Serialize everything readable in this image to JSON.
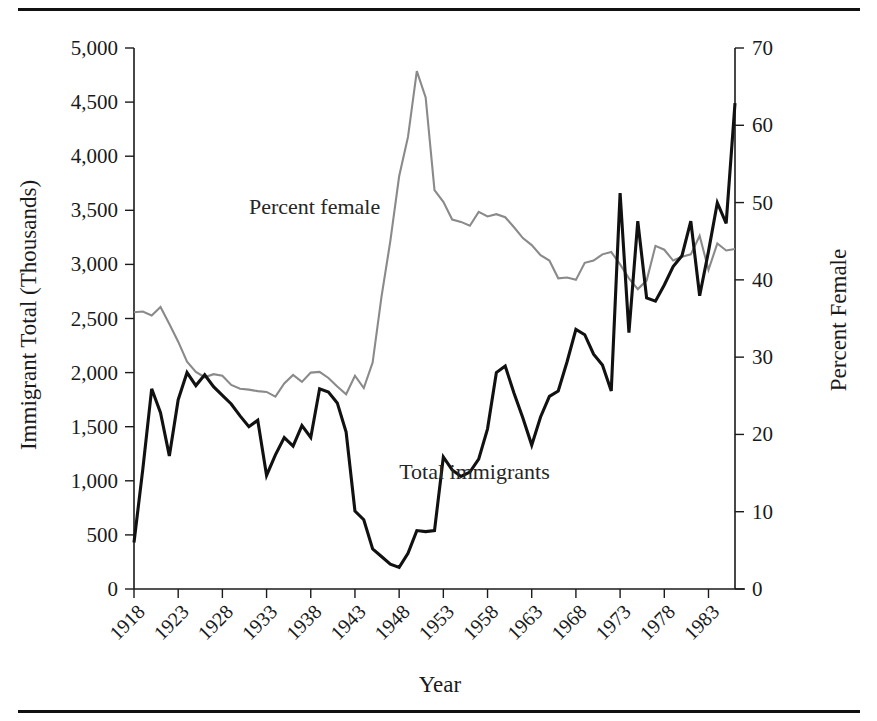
{
  "figure": {
    "top_rule": "horizontal-rule",
    "bottom_rule": "horizontal-rule"
  },
  "chart_data": {
    "type": "line",
    "title": "",
    "xlabel": "Year",
    "ylabel": "Immigrant Total (Thousands)",
    "y2label": "Percent Female",
    "grid": false,
    "legend": "inline-annotations",
    "xlim": [
      1918,
      1986
    ],
    "ylim": [
      0,
      5000
    ],
    "y2lim": [
      0,
      70
    ],
    "yticks": [
      "0",
      "500",
      "1,000",
      "1,500",
      "2,000",
      "2,500",
      "3,000",
      "3,500",
      "4,000",
      "4,500",
      "5,000"
    ],
    "ytick_values": [
      0,
      500,
      1000,
      1500,
      2000,
      2500,
      3000,
      3500,
      4000,
      4500,
      5000
    ],
    "y2ticks": [
      "0",
      "10",
      "20",
      "30",
      "40",
      "50",
      "60",
      "70"
    ],
    "y2tick_values": [
      0,
      10,
      20,
      30,
      40,
      50,
      60,
      70
    ],
    "xticks": [
      "1918",
      "1923",
      "1928",
      "1933",
      "1938",
      "1943",
      "1948",
      "1953",
      "1958",
      "1963",
      "1968",
      "1973",
      "1978",
      "1983"
    ],
    "xtick_values": [
      1918,
      1923,
      1928,
      1933,
      1938,
      1943,
      1948,
      1953,
      1958,
      1963,
      1968,
      1973,
      1978,
      1983
    ],
    "x": [
      1918,
      1919,
      1920,
      1921,
      1922,
      1923,
      1924,
      1925,
      1926,
      1927,
      1928,
      1929,
      1930,
      1931,
      1932,
      1933,
      1934,
      1935,
      1936,
      1937,
      1938,
      1939,
      1940,
      1941,
      1942,
      1943,
      1944,
      1945,
      1946,
      1947,
      1948,
      1949,
      1950,
      1951,
      1952,
      1953,
      1954,
      1955,
      1956,
      1957,
      1958,
      1959,
      1960,
      1961,
      1962,
      1963,
      1964,
      1965,
      1966,
      1967,
      1968,
      1969,
      1970,
      1971,
      1972,
      1973,
      1974,
      1975,
      1976,
      1977,
      1978,
      1979,
      1980,
      1981,
      1982,
      1983,
      1984,
      1985,
      1986
    ],
    "series": [
      {
        "name": "Total immigrants",
        "axis": "left",
        "units": "thousands",
        "color": "#111111",
        "label_position": {
          "x": 1948,
          "y": 1020
        },
        "values": [
          430,
          1110,
          1850,
          1630,
          1230,
          1750,
          2000,
          1880,
          1980,
          1870,
          1790,
          1710,
          1600,
          1500,
          1560,
          1050,
          1240,
          1400,
          1320,
          1510,
          1400,
          1850,
          1820,
          1720,
          1450,
          720,
          640,
          370,
          300,
          230,
          200,
          330,
          540,
          530,
          540,
          1220,
          1100,
          1040,
          1080,
          1200,
          1480,
          2000,
          2060,
          1810,
          1580,
          1330,
          1590,
          1780,
          1830,
          2100,
          2400,
          2350,
          2170,
          2070,
          1830,
          3660,
          2370,
          3400,
          2690,
          2660,
          2810,
          2980,
          3080,
          3400,
          2710,
          3120,
          3570,
          3380,
          4490
        ]
      },
      {
        "name": "Percent female",
        "axis": "right",
        "units": "percent",
        "color": "#8a8a8a",
        "label_position": {
          "x": 1931,
          "y": 48.5
        },
        "values": [
          35.8,
          35.9,
          35.4,
          36.5,
          34.3,
          32.0,
          29.4,
          28.1,
          27.4,
          27.8,
          27.6,
          26.4,
          25.9,
          25.8,
          25.6,
          25.5,
          24.9,
          26.6,
          27.7,
          26.8,
          28.0,
          28.1,
          27.3,
          26.2,
          25.2,
          27.6,
          26.0,
          29.3,
          37.8,
          45.0,
          53.4,
          58.5,
          67.0,
          63.6,
          51.6,
          50.1,
          47.8,
          47.5,
          47.0,
          48.8,
          48.2,
          48.5,
          48.1,
          46.8,
          45.4,
          44.5,
          43.2,
          42.5,
          40.2,
          40.3,
          40.0,
          42.2,
          42.5,
          43.3,
          43.6,
          42.0,
          40.2,
          38.8,
          39.9,
          44.4,
          43.9,
          42.5,
          43.0,
          43.3,
          45.7,
          41.3,
          44.7,
          43.8,
          44.0
        ]
      }
    ]
  }
}
